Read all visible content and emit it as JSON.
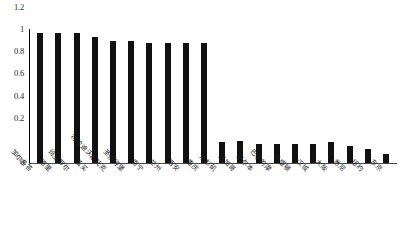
{
  "chart_data": {
    "type": "bar",
    "title": "",
    "xlabel": "",
    "ylabel": "",
    "ylim": [
      0,
      1.2
    ],
    "grid": false,
    "legend": "none",
    "yticks": [
      "1.2",
      "1",
      "0.8",
      "0.6",
      "0.4",
      "0.2",
      "0"
    ],
    "ytick_values": [
      1.2,
      1,
      0.8,
      0.6,
      0.4,
      0.2,
      0
    ],
    "categories": [
      "加尔各答",
      "德里",
      "班加罗尔",
      "孟买",
      "符拉迪沃斯托克",
      "圣彼得堡",
      "南宁",
      "兰州",
      "西安",
      "重庆",
      "洛杉矶",
      "芝加哥",
      "墨尔本",
      "巴尔的摩",
      "华盛顿",
      "汉城",
      "大阪",
      "悉尼",
      "纽约",
      "东京"
    ],
    "values": [
      1.0,
      1.0,
      1.0,
      0.97,
      0.94,
      0.94,
      0.92,
      0.92,
      0.92,
      0.92,
      0.16,
      0.17,
      0.15,
      0.15,
      0.15,
      0.15,
      0.16,
      0.13,
      0.11,
      0.07
    ],
    "bar_color": "#111111",
    "axis_color": "#4a4a4a"
  },
  "caption": {
    "text": ""
  }
}
